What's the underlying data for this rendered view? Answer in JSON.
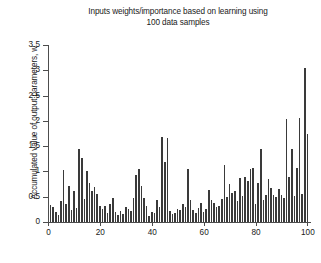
{
  "chart_data": {
    "type": "bar",
    "title": "Inputs weights/importance based on learning using\n100 data samples",
    "xlabel": "",
    "ylabel": "Accumulated value of output parameters, w",
    "xlim": [
      0,
      101
    ],
    "ylim": [
      0,
      3.5
    ],
    "grid": false,
    "legend": null,
    "bar_color": "#3a3a3a",
    "axis_color": "#4d4d4d",
    "text_color": "#1a1a1a",
    "background": "#ffffff",
    "ytick_labels": [
      "0",
      "0.5",
      "1",
      "1.5",
      "2",
      "2.5",
      "3",
      "3.5"
    ],
    "ytick_values": [
      0,
      0.5,
      1,
      1.5,
      2,
      2.5,
      3,
      3.5
    ],
    "xtick_labels": [
      "0",
      "20",
      "40",
      "60",
      "80",
      "100"
    ],
    "xtick_values": [
      0,
      20,
      40,
      60,
      80,
      100
    ],
    "categories": [
      1,
      2,
      3,
      4,
      5,
      6,
      7,
      8,
      9,
      10,
      11,
      12,
      13,
      14,
      15,
      16,
      17,
      18,
      19,
      20,
      21,
      22,
      23,
      24,
      25,
      26,
      27,
      28,
      29,
      30,
      31,
      32,
      33,
      34,
      35,
      36,
      37,
      38,
      39,
      40,
      41,
      42,
      43,
      44,
      45,
      46,
      47,
      48,
      49,
      50,
      51,
      52,
      53,
      54,
      55,
      56,
      57,
      58,
      59,
      60,
      61,
      62,
      63,
      64,
      65,
      66,
      67,
      68,
      69,
      70,
      71,
      72,
      73,
      74,
      75,
      76,
      77,
      78,
      79,
      80,
      81,
      82,
      83,
      84,
      85,
      86,
      87,
      88,
      89,
      90,
      91,
      92,
      93,
      94,
      95,
      96,
      97,
      98,
      99,
      100
    ],
    "values": [
      0.33,
      0.3,
      0.2,
      0.13,
      0.42,
      1.02,
      0.36,
      0.72,
      0.24,
      0.62,
      0.28,
      1.45,
      1.26,
      0.46,
      1.0,
      0.78,
      0.62,
      0.7,
      0.55,
      0.32,
      0.26,
      0.31,
      0.18,
      0.36,
      0.48,
      0.2,
      0.14,
      0.22,
      0.16,
      0.3,
      0.26,
      0.22,
      0.47,
      0.93,
      1.05,
      0.72,
      0.48,
      0.31,
      0.12,
      0.2,
      0.18,
      0.43,
      0.3,
      1.68,
      1.18,
      1.66,
      0.22,
      0.16,
      0.18,
      0.26,
      0.24,
      0.36,
      0.3,
      1.05,
      0.44,
      0.24,
      0.18,
      0.28,
      0.37,
      0.2,
      0.25,
      0.64,
      0.44,
      0.38,
      0.3,
      0.32,
      0.46,
      1.13,
      0.5,
      0.76,
      0.58,
      0.62,
      0.41,
      0.88,
      0.52,
      0.9,
      0.82,
      1.05,
      1.06,
      0.36,
      0.78,
      1.45,
      0.44,
      0.54,
      0.85,
      0.68,
      0.54,
      0.5,
      0.66,
      0.53,
      0.48,
      2.03,
      0.89,
      1.44,
      0.52,
      1.06,
      2.05,
      0.56,
      3.05,
      1.74
    ]
  }
}
